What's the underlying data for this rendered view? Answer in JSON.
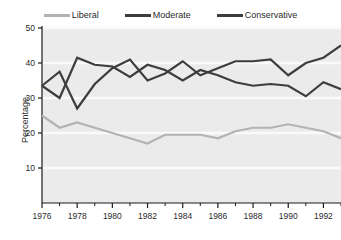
{
  "chart_data": {
    "type": "line",
    "title": "",
    "xlabel": "",
    "ylabel": "Percentage",
    "xlim": [
      1976,
      1993
    ],
    "ylim": [
      0,
      50
    ],
    "grid": true,
    "legend_position": "top",
    "x": [
      1976,
      1977,
      1978,
      1979,
      1980,
      1981,
      1982,
      1983,
      1984,
      1985,
      1986,
      1987,
      1988,
      1989,
      1990,
      1991,
      1992,
      1993
    ],
    "xticks_major": [
      1976,
      1978,
      1980,
      1982,
      1984,
      1986,
      1988,
      1990,
      1992
    ],
    "xticks_minor": [
      1977,
      1979,
      1981,
      1983,
      1985,
      1987,
      1989,
      1991,
      1993
    ],
    "yticks": [
      10,
      20,
      30,
      40,
      50
    ],
    "series": [
      {
        "name": "Liberal",
        "color": "#b3b3b3",
        "values": [
          25.0,
          21.5,
          23.0,
          21.5,
          20.0,
          18.5,
          17.0,
          19.5,
          19.5,
          19.5,
          18.5,
          20.5,
          21.5,
          21.5,
          22.5,
          21.5,
          20.5,
          18.5
        ]
      },
      {
        "name": "Moderate",
        "color": "#3d3d3d",
        "values": [
          33.5,
          37.5,
          27.0,
          34.0,
          38.5,
          41.0,
          35.0,
          37.0,
          40.5,
          36.5,
          38.5,
          40.5,
          40.5,
          41.0,
          36.5,
          40.0,
          41.5,
          45.0
        ]
      },
      {
        "name": "Conservative",
        "color": "#3d3d3d",
        "values": [
          33.5,
          30.0,
          41.5,
          39.5,
          39.0,
          36.0,
          39.5,
          38.0,
          35.0,
          38.0,
          36.5,
          34.5,
          33.5,
          34.0,
          33.5,
          30.5,
          34.5,
          32.5
        ]
      }
    ]
  },
  "legend": {
    "items": [
      {
        "label": "Liberal",
        "color": "#b3b3b3"
      },
      {
        "label": "Moderate",
        "color": "#3d3d3d"
      },
      {
        "label": "Conservative",
        "color": "#3d3d3d"
      }
    ]
  },
  "axes": {
    "y_title": "Percentage",
    "y_tick_labels": [
      "50",
      "40",
      "30",
      "20",
      "10"
    ],
    "x_tick_labels": [
      "1976",
      "1978",
      "1980",
      "1982",
      "1984",
      "1986",
      "1988",
      "1990",
      "1992"
    ]
  },
  "style": {
    "plot_background": "#ebebeb",
    "gridline_color": "#fafafa",
    "axis_color": "#1a1a1a",
    "text_color": "#2b2b2b"
  }
}
